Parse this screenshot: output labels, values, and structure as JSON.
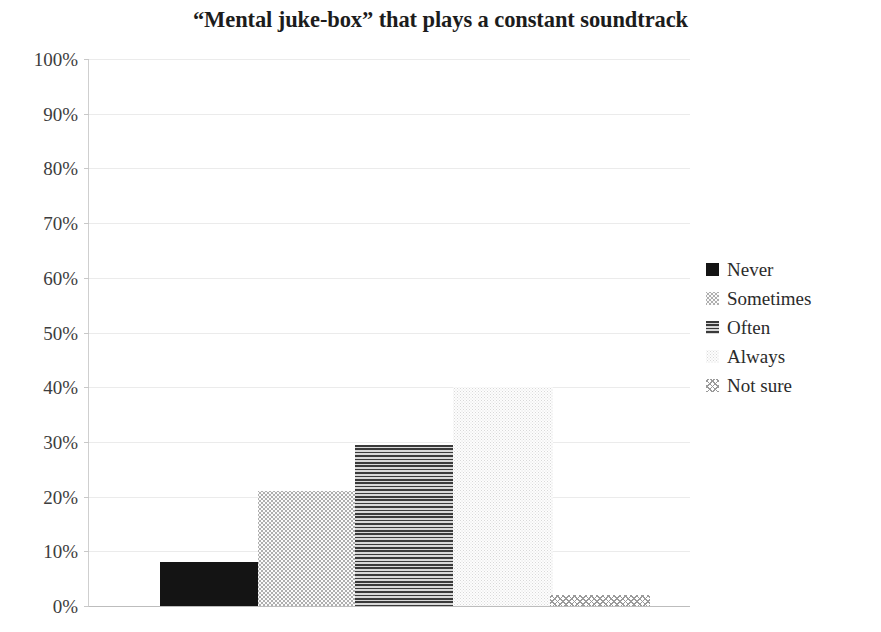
{
  "chart_data": {
    "type": "bar",
    "title": "“Mental juke-box” that plays a constant soundtrack",
    "xlabel": "",
    "ylabel": "",
    "ylim": [
      0,
      100
    ],
    "ytick_labels": [
      "100%",
      "90%",
      "80%",
      "70%",
      "60%",
      "50%",
      "40%",
      "30%",
      "20%",
      "10%",
      "0%"
    ],
    "ytick_values": [
      100,
      90,
      80,
      70,
      60,
      50,
      40,
      30,
      20,
      10,
      0
    ],
    "grid": true,
    "legend_position": "right",
    "categories": [
      "Never",
      "Sometimes",
      "Often",
      "Always",
      "Not sure"
    ],
    "values": [
      8,
      21,
      29.5,
      40,
      2
    ],
    "series": [
      {
        "name": "Never",
        "value": 8,
        "value_label": "8%",
        "pattern": "solid-black",
        "color": "#141414"
      },
      {
        "name": "Sometimes",
        "value": 21,
        "value_label": "21%",
        "pattern": "light-dotted",
        "color": "#a9a9a9"
      },
      {
        "name": "Often",
        "value": 29.5,
        "value_label": "29.5%",
        "pattern": "horizontal-lines",
        "color": "#3a3a3a"
      },
      {
        "name": "Always",
        "value": 40,
        "value_label": "40%",
        "pattern": "very-light-dotted",
        "color": "#dedede"
      },
      {
        "name": "Not sure",
        "value": 2,
        "value_label": "2%",
        "pattern": "checkered-dots",
        "color": "#9a9a9a"
      }
    ]
  },
  "legend": {
    "items": [
      {
        "label": "Never"
      },
      {
        "label": "Sometimes"
      },
      {
        "label": "Often"
      },
      {
        "label": "Always"
      },
      {
        "label": "Not sure"
      }
    ]
  }
}
